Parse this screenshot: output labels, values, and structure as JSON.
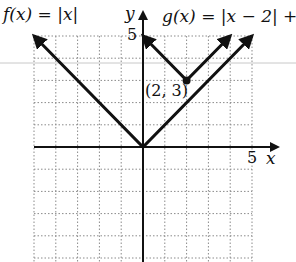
{
  "chart_data": {
    "type": "line",
    "title": "",
    "xlabel": "x",
    "ylabel": "y",
    "xlim": [
      -5,
      5
    ],
    "ylim": [
      -5,
      5
    ],
    "grid": true,
    "grid_style": "dotted",
    "tick_labels": {
      "x": [
        "5"
      ],
      "y": [
        "5"
      ]
    },
    "series": [
      {
        "name": "f(x) = |x|",
        "expression": "|x|",
        "vertex": [
          0,
          0
        ],
        "points": [
          [
            -5,
            5
          ],
          [
            0,
            0
          ],
          [
            5,
            5
          ]
        ],
        "arrows": true
      },
      {
        "name": "g(x) = |x − 2| + 3",
        "expression": "|x - 2| + 3",
        "vertex": [
          2,
          3
        ],
        "points": [
          [
            0,
            5
          ],
          [
            2,
            3
          ],
          [
            4,
            5
          ]
        ],
        "arrows": true
      }
    ],
    "annotations": [
      {
        "text": "(2, 3)",
        "point": [
          2,
          3
        ],
        "marker": "dot"
      }
    ]
  },
  "labels": {
    "f_label": "f(x) = |x|",
    "g_label": "g(x) = |x − 2| + 3",
    "x_axis": "x",
    "y_axis": "y",
    "x_tick": "5",
    "y_tick": "5",
    "point_label": "(2, 3)"
  },
  "colors": {
    "curve": "#111111",
    "axis": "#111111",
    "grid": "#8a8a8a",
    "background": "#ffffff"
  }
}
